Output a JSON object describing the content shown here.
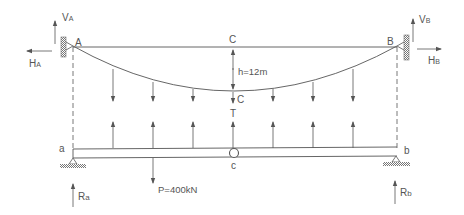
{
  "diagram": {
    "colors": {
      "line": "#555555",
      "hatch": "#777777",
      "text": "#555555"
    },
    "nodes": {
      "A": {
        "label": "A",
        "x": 73,
        "y": 46
      },
      "B": {
        "label": "B",
        "x": 397,
        "y": 46
      },
      "C_top": {
        "label": "C",
        "x": 233,
        "y": 47
      },
      "C_cable": {
        "label": "C",
        "x": 233,
        "y": 91
      },
      "a": {
        "label": "a",
        "x": 73,
        "y": 148
      },
      "b": {
        "label": "b",
        "x": 397,
        "y": 148
      },
      "c": {
        "label": "c",
        "x": 233,
        "y": 152
      }
    },
    "labels": {
      "VA_main": "V",
      "VA_sub": "A",
      "VB_main": "V",
      "VB_sub": "B",
      "HA_main": "H",
      "HA_sub": "A",
      "HB_main": "H",
      "HB_sub": "B",
      "Ra_main": "R",
      "Ra_sub": "a",
      "Rb_main": "R",
      "Rb_sub": "b",
      "A": "A",
      "B": "B",
      "C_top": "C",
      "C_cable": "C",
      "T": "T",
      "sag": "h=12m",
      "a": "a",
      "b": "b",
      "c": "c",
      "load": "P=400kN"
    },
    "sag_h": "12m",
    "point_load": "400kN",
    "hanger_x": [
      113,
      153,
      193,
      233,
      273,
      313,
      353
    ]
  }
}
